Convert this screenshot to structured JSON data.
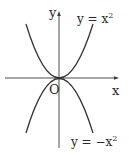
{
  "figure": {
    "axis_x_label": "x",
    "axis_y_label": "y",
    "origin_label": "O",
    "curves": [
      {
        "name": "upper-parabola",
        "label_base": "y = x",
        "label_exp": "2",
        "equation": "y = x^2"
      },
      {
        "name": "lower-parabola",
        "label_base": "y = −x",
        "label_exp": "2",
        "equation": "y = -x^2"
      }
    ],
    "colors": {
      "line": "#3a3a3a",
      "text": "#2a2a2a",
      "background": "#ffffff"
    }
  }
}
